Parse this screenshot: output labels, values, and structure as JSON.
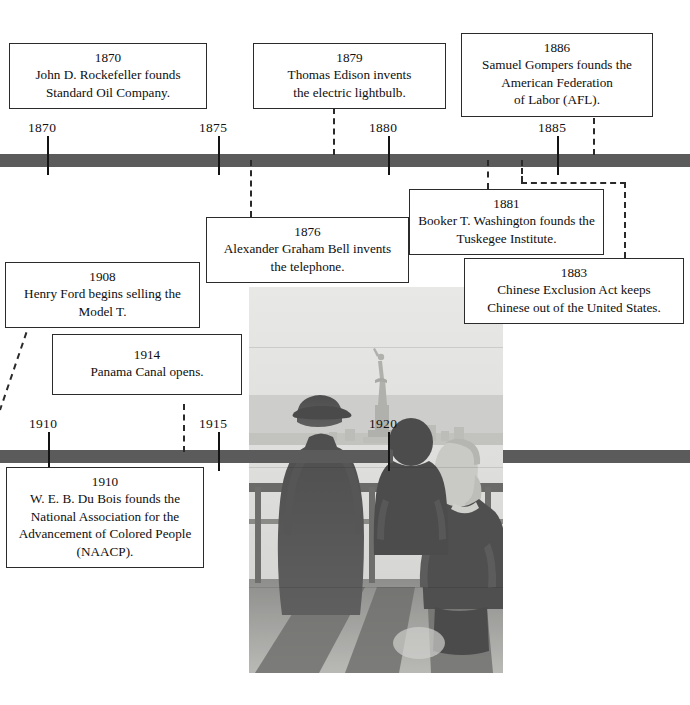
{
  "figure": {
    "kind": "historical-timeline",
    "bar_color": "#5b5b5b",
    "tick_color": "#141414",
    "box_border_color": "#2b2b2b",
    "connector_style": "dashed"
  },
  "timelines": [
    {
      "id": "upper",
      "ticks": [
        {
          "label": "1870",
          "x": 47
        },
        {
          "label": "1875",
          "x": 218
        },
        {
          "label": "1880",
          "x": 388
        },
        {
          "label": "1885",
          "x": 557
        }
      ]
    },
    {
      "id": "lower",
      "ticks": [
        {
          "label": "1910",
          "x": 48
        },
        {
          "label": "1915",
          "x": 218
        },
        {
          "label": "1920",
          "x": 388
        }
      ]
    }
  ],
  "events": [
    {
      "id": "e1870",
      "year": "1870",
      "text": "John D. Rockefeller founds Standard Oil Company.",
      "lines": [
        "John D. Rockefeller founds",
        "Standard Oil Company."
      ]
    },
    {
      "id": "e1879",
      "year": "1879",
      "text": "Thomas Edison invents the electric lightbulb.",
      "lines": [
        "Thomas Edison invents",
        "the electric lightbulb."
      ]
    },
    {
      "id": "e1886",
      "year": "1886",
      "text": "Samuel Gompers founds the American Federation of Labor (AFL).",
      "lines": [
        "Samuel Gompers founds the",
        "American Federation",
        "of Labor (AFL)."
      ]
    },
    {
      "id": "e1876",
      "year": "1876",
      "text": "Alexander Graham Bell invents the telephone.",
      "lines": [
        "Alexander Graham Bell invents",
        "the telephone."
      ]
    },
    {
      "id": "e1881",
      "year": "1881",
      "text": "Booker T. Washington founds the Tuskegee Institute.",
      "lines": [
        "Booker T. Washington founds the",
        "Tuskegee Institute."
      ]
    },
    {
      "id": "e1883",
      "year": "1883",
      "text": "Chinese Exclusion Act keeps Chinese out of the United States.",
      "lines": [
        "Chinese Exclusion Act keeps",
        "Chinese out of the United States."
      ]
    },
    {
      "id": "e1908",
      "year": "1908",
      "text": "Henry Ford begins selling the Model T.",
      "lines": [
        "Henry Ford begins selling the",
        "Model T."
      ]
    },
    {
      "id": "e1914",
      "year": "1914",
      "text": "Panama Canal opens.",
      "lines": [
        "Panama Canal opens."
      ]
    },
    {
      "id": "e1910",
      "year": "1910",
      "text": "W. E. B. Du Bois founds the National Association for the Advancement of Colored People (NAACP).",
      "lines": [
        "W. E. B. Du Bois founds the",
        "National Association for the",
        "Advancement of Colored People",
        "(NAACP)."
      ]
    }
  ],
  "photo": {
    "caption_visible": false,
    "description": "Black-and-white photograph of an immigrant family seen from behind on a ship deck, looking toward the Statue of Liberty"
  }
}
